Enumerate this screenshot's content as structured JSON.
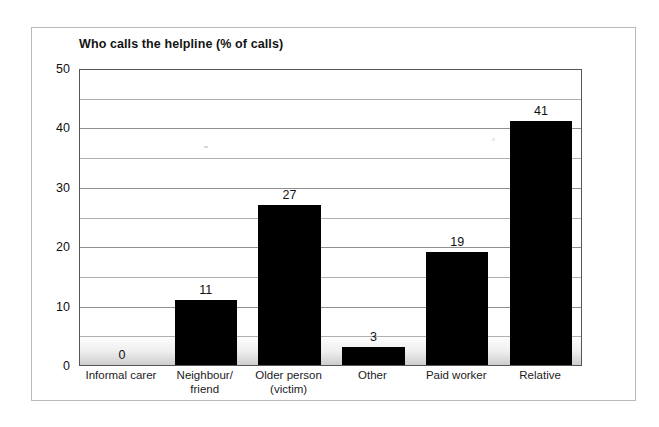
{
  "chart_data": {
    "type": "bar",
    "title": "Who calls the helpline (% of calls)",
    "xlabel": "",
    "ylabel": "",
    "ylim": [
      0,
      50
    ],
    "ytick_step": 10,
    "minor_gridline_step": 5,
    "grid": true,
    "legend": false,
    "bar_color": "#000000",
    "categories": [
      "Informal carer",
      "Neighbour/ friend",
      "Older person (victim)",
      "Other",
      "Paid worker",
      "Relative"
    ],
    "category_lines": [
      [
        "Informal carer"
      ],
      [
        "Neighbour/",
        "friend"
      ],
      [
        "Older person",
        "(victim)"
      ],
      [
        "Other"
      ],
      [
        "Paid worker"
      ],
      [
        "Relative"
      ]
    ],
    "values": [
      0,
      11,
      27,
      3,
      19,
      41
    ],
    "value_labels": [
      "0",
      "11",
      "27",
      "3",
      "19",
      "41"
    ],
    "ytick_labels": [
      "0",
      "10",
      "20",
      "30",
      "40",
      "50"
    ],
    "ytick_values": [
      0,
      10,
      20,
      30,
      40,
      50
    ]
  },
  "figure": {
    "frame_color": "#b9b9b9",
    "axis_color": "#555555",
    "gridline_color": "#8f8f8f",
    "background": "#ffffff"
  }
}
